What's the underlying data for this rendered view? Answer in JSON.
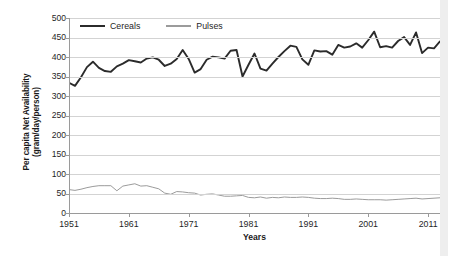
{
  "chart_data": {
    "type": "line",
    "title": "",
    "xlabel": "Years",
    "ylabel": "Per capita Net Availability (gram/day/person)",
    "ylabel_line1": "Per capita Net Availability",
    "ylabel_line2": "(gram/day/person)",
    "ylim": [
      0,
      500
    ],
    "xlim": [
      1951,
      2013
    ],
    "yticks": [
      500,
      450,
      400,
      350,
      300,
      250,
      200,
      150,
      100,
      50,
      0
    ],
    "xticks": [
      1951,
      1961,
      1971,
      1981,
      1991,
      2001,
      2011
    ],
    "grid": "horizontal",
    "legend_position": "top-left-inside",
    "colors": {
      "cereals": "#2b2b2b",
      "pulses": "#9b9b9b",
      "gridline": "#d3d3d3",
      "axis": "#9a9a9a",
      "background": "#ffffff"
    },
    "x": [
      1951,
      1952,
      1953,
      1954,
      1955,
      1956,
      1957,
      1958,
      1959,
      1960,
      1961,
      1962,
      1963,
      1964,
      1965,
      1966,
      1967,
      1968,
      1969,
      1970,
      1971,
      1972,
      1973,
      1974,
      1975,
      1976,
      1977,
      1978,
      1979,
      1980,
      1981,
      1982,
      1983,
      1984,
      1985,
      1986,
      1987,
      1988,
      1989,
      1990,
      1991,
      1992,
      1993,
      1994,
      1995,
      1996,
      1997,
      1998,
      1999,
      2000,
      2001,
      2002,
      2003,
      2004,
      2005,
      2006,
      2007,
      2008,
      2009,
      2010,
      2011,
      2012,
      2013
    ],
    "series": [
      {
        "name": "Cereals",
        "color": "#2b2b2b",
        "linewidth": 1.9,
        "values": [
          334,
          326,
          348,
          374,
          388,
          372,
          364,
          362,
          376,
          383,
          392,
          389,
          386,
          396,
          399,
          393,
          377,
          383,
          395,
          418,
          395,
          360,
          369,
          393,
          401,
          399,
          396,
          416,
          418,
          350,
          380,
          409,
          370,
          365,
          383,
          400,
          415,
          429,
          426,
          394,
          380,
          417,
          414,
          415,
          406,
          431,
          424,
          427,
          435,
          424,
          443,
          465,
          425,
          428,
          424,
          441,
          451,
          431,
          463,
          410,
          424,
          422,
          383
        ],
        "values_continued_note": "see values2 for 2003-2013 tail"
      },
      {
        "name": "Pulses",
        "color": "#9b9b9b",
        "linewidth": 1.0,
        "values": [
          60,
          58,
          61,
          65,
          68,
          70,
          70,
          70,
          57,
          69,
          72,
          75,
          69,
          70,
          66,
          62,
          51,
          48,
          55,
          54,
          52,
          51,
          46,
          48,
          49,
          46,
          43,
          43,
          44,
          45,
          40,
          39,
          41,
          38,
          40,
          39,
          41,
          40,
          40,
          41,
          40,
          38,
          37,
          37,
          38,
          37,
          35,
          35,
          36,
          35,
          34,
          34,
          34,
          33,
          34,
          35,
          36,
          37,
          38,
          36,
          37,
          38,
          39
        ]
      }
    ],
    "legend_entries": [
      {
        "label": "Cereals",
        "color": "#2b2b2b",
        "style": "thick-solid"
      },
      {
        "label": "Pulses",
        "color": "#9b9b9b",
        "style": "thin-solid"
      }
    ],
    "cereals_points": [
      [
        1951,
        334
      ],
      [
        1952,
        326
      ],
      [
        1953,
        348
      ],
      [
        1954,
        374
      ],
      [
        1955,
        388
      ],
      [
        1956,
        372
      ],
      [
        1957,
        364
      ],
      [
        1958,
        362
      ],
      [
        1959,
        376
      ],
      [
        1960,
        383
      ],
      [
        1961,
        392
      ],
      [
        1962,
        389
      ],
      [
        1963,
        386
      ],
      [
        1964,
        396
      ],
      [
        1965,
        399
      ],
      [
        1966,
        393
      ],
      [
        1967,
        377
      ],
      [
        1968,
        383
      ],
      [
        1969,
        395
      ],
      [
        1970,
        418
      ],
      [
        1971,
        395
      ],
      [
        1972,
        360
      ],
      [
        1973,
        369
      ],
      [
        1974,
        393
      ],
      [
        1975,
        401
      ],
      [
        1976,
        399
      ],
      [
        1977,
        396
      ],
      [
        1978,
        416
      ],
      [
        1979,
        418
      ],
      [
        1980,
        350
      ],
      [
        1981,
        380
      ],
      [
        1982,
        409
      ],
      [
        1983,
        370
      ],
      [
        1984,
        365
      ],
      [
        1985,
        383
      ],
      [
        1986,
        400
      ],
      [
        1987,
        415
      ],
      [
        1988,
        429
      ],
      [
        1989,
        426
      ],
      [
        1990,
        394
      ],
      [
        1991,
        380
      ],
      [
        1992,
        417
      ],
      [
        1993,
        414
      ],
      [
        1994,
        415
      ],
      [
        1995,
        406
      ],
      [
        1996,
        431
      ],
      [
        1997,
        424
      ],
      [
        1998,
        427
      ],
      [
        1999,
        435
      ],
      [
        2000,
        424
      ],
      [
        2001,
        443
      ],
      [
        2002,
        465
      ],
      [
        2003,
        425
      ],
      [
        2004,
        428
      ],
      [
        2005,
        424
      ],
      [
        2006,
        441
      ],
      [
        2007,
        451
      ],
      [
        2008,
        431
      ],
      [
        2009,
        463
      ],
      [
        2010,
        410
      ],
      [
        2011,
        424
      ],
      [
        2012,
        422
      ],
      [
        2013,
        440
      ]
    ],
    "pulses_points": [
      [
        1951,
        60
      ],
      [
        1952,
        58
      ],
      [
        1953,
        61
      ],
      [
        1954,
        65
      ],
      [
        1955,
        68
      ],
      [
        1956,
        70
      ],
      [
        1957,
        70
      ],
      [
        1958,
        70
      ],
      [
        1959,
        57
      ],
      [
        1960,
        69
      ],
      [
        1961,
        72
      ],
      [
        1962,
        75
      ],
      [
        1963,
        69
      ],
      [
        1964,
        70
      ],
      [
        1965,
        66
      ],
      [
        1966,
        62
      ],
      [
        1967,
        51
      ],
      [
        1968,
        48
      ],
      [
        1969,
        55
      ],
      [
        1970,
        54
      ],
      [
        1971,
        52
      ],
      [
        1972,
        51
      ],
      [
        1973,
        46
      ],
      [
        1974,
        48
      ],
      [
        1975,
        49
      ],
      [
        1976,
        46
      ],
      [
        1977,
        43
      ],
      [
        1978,
        43
      ],
      [
        1979,
        44
      ],
      [
        1980,
        45
      ],
      [
        1981,
        40
      ],
      [
        1982,
        39
      ],
      [
        1983,
        41
      ],
      [
        1984,
        38
      ],
      [
        1985,
        40
      ],
      [
        1986,
        39
      ],
      [
        1987,
        41
      ],
      [
        1988,
        40
      ],
      [
        1989,
        40
      ],
      [
        1990,
        41
      ],
      [
        1991,
        40
      ],
      [
        1992,
        38
      ],
      [
        1993,
        37
      ],
      [
        1994,
        37
      ],
      [
        1995,
        38
      ],
      [
        1996,
        37
      ],
      [
        1997,
        35
      ],
      [
        1998,
        35
      ],
      [
        1999,
        36
      ],
      [
        2000,
        35
      ],
      [
        2001,
        34
      ],
      [
        2002,
        34
      ],
      [
        2003,
        34
      ],
      [
        2004,
        33
      ],
      [
        2005,
        34
      ],
      [
        2006,
        35
      ],
      [
        2007,
        36
      ],
      [
        2008,
        37
      ],
      [
        2009,
        38
      ],
      [
        2010,
        36
      ],
      [
        2011,
        37
      ],
      [
        2012,
        38
      ],
      [
        2013,
        39
      ]
    ]
  },
  "axes": {
    "y_title_line1": "Per capita Net Availability",
    "y_title_line2": "(gram/day/person)",
    "x_title": "Years",
    "y_tick_labels": [
      "500",
      "450",
      "400",
      "350",
      "300",
      "250",
      "200",
      "150",
      "100",
      "50",
      "0"
    ],
    "x_tick_labels": [
      "1951",
      "1961",
      "1971",
      "1981",
      "1991",
      "2001",
      "2011"
    ]
  },
  "legend": {
    "cereals_label": "Cereals",
    "pulses_label": "Pulses"
  }
}
